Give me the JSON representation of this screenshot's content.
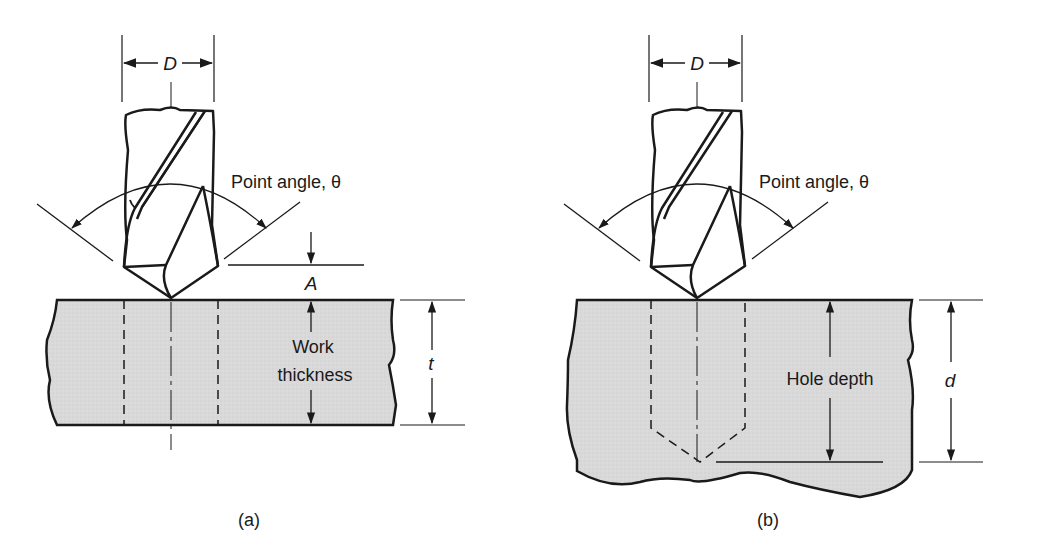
{
  "figure": {
    "panels": [
      {
        "id": "a",
        "caption": "(a)",
        "diameter_label": "D",
        "point_angle_label": "Point angle, θ",
        "approach_label": "A",
        "work_label_line1": "Work",
        "work_label_line2": "thickness",
        "dimension_label": "t"
      },
      {
        "id": "b",
        "caption": "(b)",
        "diameter_label": "D",
        "point_angle_label": "Point angle, θ",
        "hole_label": "Hole depth",
        "dimension_label": "d"
      }
    ],
    "colors": {
      "line": "#1a1a1a",
      "workpiece_fill": "#d9d9d9",
      "background": "#ffffff"
    }
  }
}
